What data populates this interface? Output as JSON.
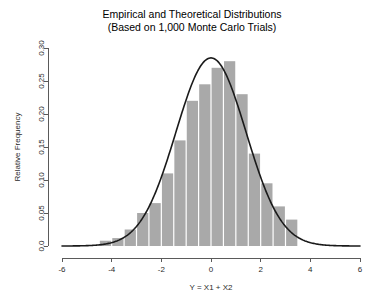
{
  "chart_data": {
    "type": "bar",
    "title": "Empirical and Theoretical Distributions",
    "subtitle": "(Based on 1,000 Monte Carlo Trials)",
    "xlabel": "Y = X1 + X2",
    "ylabel": "Relative Frequency",
    "xlim": [
      -6,
      6
    ],
    "ylim": [
      0.0,
      0.3
    ],
    "xticks": [
      -6,
      -4,
      -2,
      0,
      2,
      4,
      6
    ],
    "xtick_labels": [
      "-6",
      "-4",
      "-2",
      "0",
      "2",
      "4",
      "6"
    ],
    "yticks": [
      0.0,
      0.05,
      0.1,
      0.15,
      0.2,
      0.25,
      0.3
    ],
    "ytick_labels": [
      "0.0",
      "0.05",
      "0.10",
      "0.15",
      "0.20",
      "0.25",
      "0.30"
    ],
    "grid": false,
    "legend": "none",
    "bar_color": "#a9a9a9",
    "curve_color": "#1a1a1a",
    "bin_width": 0.5,
    "bin_centers": [
      -4.25,
      -3.75,
      -3.25,
      -2.75,
      -2.25,
      -1.75,
      -1.25,
      -0.75,
      -0.25,
      0.25,
      0.75,
      1.25,
      1.75,
      2.25,
      2.75,
      3.25
    ],
    "categories": [
      "-4.25",
      "-3.75",
      "-3.25",
      "-2.75",
      "-2.25",
      "-1.75",
      "-1.25",
      "-0.75",
      "-0.25",
      "0.25",
      "0.75",
      "1.25",
      "1.75",
      "2.25",
      "2.75",
      "3.25"
    ],
    "values": [
      0.008,
      0.012,
      0.025,
      0.05,
      0.065,
      0.11,
      0.16,
      0.22,
      0.245,
      0.27,
      0.28,
      0.23,
      0.14,
      0.095,
      0.06,
      0.04
    ],
    "series": [
      {
        "name": "Empirical histogram",
        "type": "bar",
        "values": [
          0.008,
          0.012,
          0.025,
          0.05,
          0.065,
          0.11,
          0.16,
          0.22,
          0.245,
          0.27,
          0.28,
          0.23,
          0.14,
          0.095,
          0.06,
          0.04
        ]
      },
      {
        "name": "Theoretical normal density",
        "type": "line",
        "mean": 0.0,
        "sd": 1.41,
        "peak": 0.285
      }
    ]
  }
}
